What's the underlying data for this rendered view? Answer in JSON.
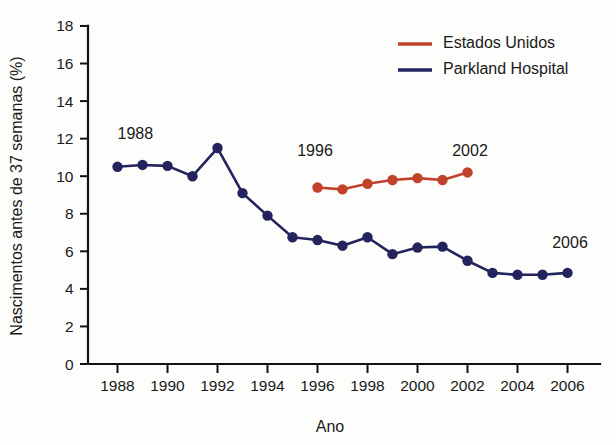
{
  "chart_data": {
    "type": "line",
    "title": "",
    "xlabel": "Ano",
    "ylabel": "Nascimentos antes de 37 semanas (%)",
    "xlim": [
      1987,
      2007
    ],
    "ylim": [
      0,
      18
    ],
    "grid": false,
    "legend_position": "top-right",
    "x_ticks": [
      1988,
      1990,
      1992,
      1994,
      1996,
      1998,
      2000,
      2002,
      2004,
      2006
    ],
    "x_tick_labels": [
      "1988",
      "1990",
      "1992",
      "1994",
      "1996",
      "1998",
      "2000",
      "2002",
      "2004",
      "2006"
    ],
    "y_ticks": [
      0,
      2,
      4,
      6,
      8,
      10,
      12,
      14,
      16,
      18
    ],
    "y_tick_labels": [
      "0",
      "2",
      "4",
      "6",
      "8",
      "10",
      "12",
      "14",
      "16",
      "18"
    ],
    "series": [
      {
        "name": "Estados Unidos",
        "color": "#c0422a",
        "x": [
          1996,
          1997,
          1998,
          1999,
          2000,
          2001,
          2002
        ],
        "values": [
          9.4,
          9.3,
          9.6,
          9.8,
          9.9,
          9.8,
          10.2
        ]
      },
      {
        "name": "Parkland Hospital",
        "color": "#23235e",
        "x": [
          1988,
          1989,
          1990,
          1991,
          1992,
          1993,
          1994,
          1995,
          1996,
          1997,
          1998,
          1999,
          2000,
          2001,
          2002,
          2003,
          2004,
          2005,
          2006
        ],
        "values": [
          10.5,
          10.6,
          10.55,
          10.0,
          11.5,
          9.1,
          7.9,
          6.75,
          6.6,
          6.3,
          6.75,
          5.85,
          6.2,
          6.25,
          5.5,
          4.85,
          4.75,
          4.75,
          4.85
        ]
      }
    ],
    "annotations": [
      {
        "text": "1988",
        "x": 1988.0,
        "y": 12.0,
        "series": "Parkland Hospital",
        "align": "start"
      },
      {
        "text": "1996",
        "x": 1995.9,
        "y": 11.1,
        "series": "Estados Unidos",
        "align": "middle"
      },
      {
        "text": "2002",
        "x": 2002.1,
        "y": 11.1,
        "series": "Estados Unidos",
        "align": "middle"
      },
      {
        "text": "2006",
        "x": 2006.1,
        "y": 6.2,
        "series": "Parkland Hospital",
        "align": "middle"
      }
    ]
  },
  "legend": {
    "entries": [
      {
        "label": "Estados Unidos",
        "color": "#c0422a"
      },
      {
        "label": "Parkland Hospital",
        "color": "#23235e"
      }
    ]
  },
  "axes": {
    "x_title": "Ano",
    "y_title": "Nascimentos antes de 37 semanas (%)"
  }
}
